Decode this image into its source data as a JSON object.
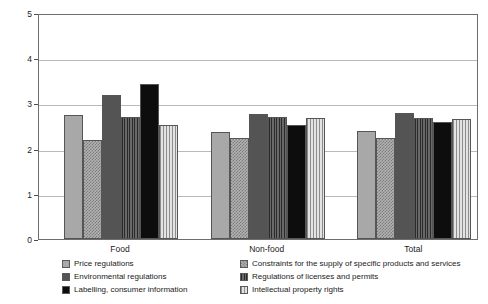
{
  "chart_data": {
    "type": "bar",
    "title": "",
    "subtitle": "",
    "xlabel": "",
    "ylabel": "Importance",
    "ylim": [
      0,
      5
    ],
    "yticks": [
      "0",
      "1",
      "2",
      "3",
      "4",
      "5"
    ],
    "grid": true,
    "legend_position": "below-axis, two columns",
    "categories": [
      "Food",
      "Non-food",
      "Total"
    ],
    "series": [
      {
        "name": "Price regulations",
        "fill": "solid-light",
        "color": "#a8a8a8",
        "values": [
          2.74,
          2.37,
          2.39
        ]
      },
      {
        "name": "Constraints for the supply of specific products and services",
        "fill": "check-light",
        "color": "#b2b2b2",
        "values": [
          2.18,
          2.23,
          2.23
        ]
      },
      {
        "name": "Environmental regulations",
        "fill": "solid-dark",
        "color": "#545454",
        "values": [
          3.18,
          2.76,
          2.78
        ]
      },
      {
        "name": "Regulations of licenses and permits",
        "fill": "vhatch-dark",
        "color": "#5d5d5d",
        "values": [
          2.69,
          2.7,
          2.68
        ]
      },
      {
        "name": "Labelling, consumer information",
        "fill": "solid-black",
        "color": "#0d0d0d",
        "values": [
          3.43,
          2.52,
          2.58
        ]
      },
      {
        "name": "Intellectual property rights",
        "fill": "vstripe-light",
        "color": "#cacaca",
        "values": [
          2.53,
          2.67,
          2.65
        ]
      }
    ]
  },
  "axis": {
    "y_title": "Importance",
    "y_tick_labels": [
      "5",
      "4",
      "3",
      "2",
      "1",
      "0"
    ],
    "x_group_labels": [
      "Food",
      "Non-food",
      "Total"
    ]
  },
  "legend": {
    "left_column": [
      "Price regulations",
      "Environmental regulations",
      "Labelling, consumer information"
    ],
    "right_column": [
      "Constraints for the supply of specific products and services",
      "Regulations of licenses and permits",
      "Intellectual property rights"
    ]
  },
  "colors": {
    "frame": "#6e6e6e",
    "gridline": "#b9b9b9",
    "background": "#ffffff",
    "text": "#1a1a1a"
  }
}
